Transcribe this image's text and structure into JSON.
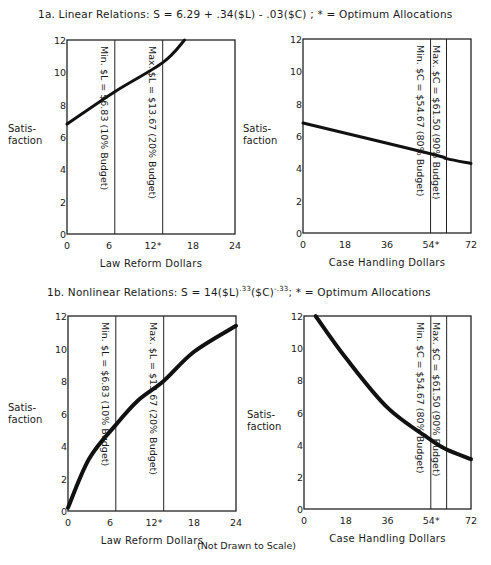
{
  "figure": {
    "title_1a": "1a.   Linear Relations:  S = 6.29 + .34($L) - .03($C) ; * = Optimum Allocations",
    "title_1b_prefix": "1b.      Nonlinear Relations:  S = 14($L)",
    "title_1b_exp1": ".33",
    "title_1b_mid": "($C)",
    "title_1b_exp2": "-.33",
    "title_1b_suffix": "; * = Optimum Allocations",
    "y_label_line1": "Satis-",
    "y_label_line2": "faction",
    "note": "(Not Drawn to Scale)"
  },
  "chart_data": [
    {
      "id": "1a-law-reform",
      "type": "line",
      "panel": "1a",
      "title": "Linear Relations: S = 6.29 + .34($L) - .03($C)",
      "xlabel": "Law Reform Dollars",
      "ylabel": "Satisfaction",
      "xlim": [
        0,
        24
      ],
      "ylim": [
        0,
        12
      ],
      "x_ticks": [
        "0",
        "6",
        "12*",
        "18",
        "24"
      ],
      "y_ticks": [
        "0",
        "2",
        "4",
        "6",
        "8",
        "10",
        "12"
      ],
      "grid": false,
      "series": [
        {
          "name": "S vs $L",
          "x": [
            0,
            6.83,
            13.67,
            16.8
          ],
          "y": [
            6.8,
            8.8,
            10.6,
            12
          ]
        }
      ],
      "reference_lines": [
        {
          "x": 6.83,
          "label": "Min. $L = $6.83 (10% Budget)"
        },
        {
          "x": 13.67,
          "label": "Max. $L = $13.67 (20% Budget)"
        }
      ]
    },
    {
      "id": "1a-case-handling",
      "type": "line",
      "panel": "1a",
      "title": "Linear Relations: S = 6.29 + .34($L) - .03($C)",
      "xlabel": "Case Handling Dollars",
      "ylabel": "Satisfaction",
      "xlim": [
        0,
        72
      ],
      "ylim": [
        0,
        12
      ],
      "x_ticks": [
        "0",
        "18",
        "36",
        "54*",
        "72"
      ],
      "y_ticks": [
        "0",
        "2",
        "4",
        "6",
        "8",
        "10",
        "12"
      ],
      "grid": false,
      "series": [
        {
          "name": "S vs $C",
          "x": [
            0,
            54.67,
            61.5,
            72
          ],
          "y": [
            6.8,
            4.9,
            4.6,
            4.3
          ]
        }
      ],
      "reference_lines": [
        {
          "x": 54.67,
          "label": "Min. $C = $54.67 (80% Budget)"
        },
        {
          "x": 61.5,
          "label": "Max. $C = $61.50 (90% Budget)"
        }
      ]
    },
    {
      "id": "1b-law-reform",
      "type": "line",
      "panel": "1b",
      "title": "Nonlinear Relations: S = 14($L)^.33($C)^-.33",
      "xlabel": "Law Reform Dollars",
      "ylabel": "Satisfaction",
      "xlim": [
        0,
        24
      ],
      "ylim": [
        0,
        12
      ],
      "x_ticks": [
        "0",
        "6",
        "12*",
        "18",
        "24"
      ],
      "y_ticks": [
        "0",
        "2",
        "4",
        "6",
        "8",
        "10",
        "12"
      ],
      "grid": false,
      "series": [
        {
          "name": "S vs $L",
          "x": [
            0,
            3,
            6.83,
            10,
            13.67,
            18,
            24
          ],
          "y": [
            0.2,
            3.2,
            5.3,
            6.8,
            8.0,
            9.8,
            11.4
          ]
        }
      ],
      "reference_lines": [
        {
          "x": 6.83,
          "label": "Min. $L = $6.83 (10% Budget)"
        },
        {
          "x": 13.67,
          "label": "Max. $L = $13.67 (20% Budget)"
        }
      ]
    },
    {
      "id": "1b-case-handling",
      "type": "line",
      "panel": "1b",
      "title": "Nonlinear Relations: S = 14($L)^.33($C)^-.33",
      "xlabel": "Case Handling Dollars",
      "ylabel": "Satisfaction",
      "xlim": [
        0,
        72
      ],
      "ylim": [
        0,
        12
      ],
      "x_ticks": [
        "0",
        "18",
        "36",
        "54*",
        "72"
      ],
      "y_ticks": [
        "0",
        "2",
        "4",
        "6",
        "8",
        "10",
        "12"
      ],
      "grid": false,
      "series": [
        {
          "name": "S vs $C",
          "x": [
            5,
            18,
            36,
            54.67,
            61.5,
            72
          ],
          "y": [
            12,
            9.4,
            6.3,
            4.3,
            3.7,
            3.1
          ]
        }
      ],
      "reference_lines": [
        {
          "x": 54.67,
          "label": "Min. $C = $54.67 (80% Budget)"
        },
        {
          "x": 61.5,
          "label": "Max. $C = $61.50 (90% Budget)"
        }
      ]
    }
  ]
}
